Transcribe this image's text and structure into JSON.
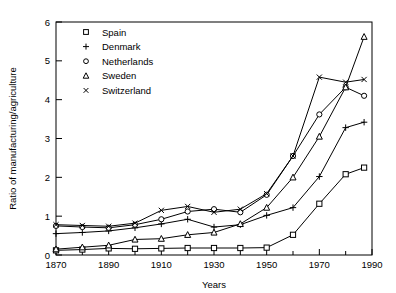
{
  "chart_data": {
    "type": "line",
    "title": "",
    "xlabel": "Years",
    "ylabel": "Ratio of manufacturing/agriculture",
    "xlim": [
      1870,
      1990
    ],
    "ylim": [
      0,
      6
    ],
    "xticks": [
      1870,
      1890,
      1910,
      1930,
      1950,
      1970,
      1990
    ],
    "xtick_labels": [
      "1870",
      "1890",
      "1910",
      "1930",
      "1950",
      "1970",
      "1990"
    ],
    "xminor_step": 10,
    "yticks": [
      0,
      1,
      2,
      3,
      4,
      5,
      6
    ],
    "ytick_labels": [
      "0",
      "1",
      "2",
      "3",
      "4",
      "5",
      "6"
    ],
    "grid": false,
    "legend_position": "top-left",
    "series": [
      {
        "name": "Spain",
        "marker": "square",
        "x": [
          1870,
          1880,
          1890,
          1900,
          1910,
          1920,
          1930,
          1940,
          1950,
          1960,
          1970,
          1980,
          1987
        ],
        "values": [
          0.12,
          0.14,
          0.17,
          0.16,
          0.17,
          0.18,
          0.18,
          0.18,
          0.19,
          0.52,
          1.32,
          2.08,
          2.25
        ]
      },
      {
        "name": "Denmark",
        "marker": "plus",
        "x": [
          1870,
          1880,
          1890,
          1900,
          1910,
          1920,
          1930,
          1940,
          1950,
          1960,
          1970,
          1980,
          1987
        ],
        "values": [
          0.55,
          0.58,
          0.62,
          0.7,
          0.8,
          0.92,
          0.72,
          0.78,
          1.02,
          1.22,
          2.02,
          3.28,
          3.42
        ]
      },
      {
        "name": "Netherlands",
        "marker": "circle",
        "x": [
          1870,
          1880,
          1890,
          1900,
          1910,
          1920,
          1930,
          1940,
          1950,
          1960,
          1970,
          1980,
          1987
        ],
        "values": [
          0.75,
          0.72,
          0.7,
          0.78,
          0.92,
          1.12,
          1.18,
          1.1,
          1.55,
          2.55,
          3.62,
          4.32,
          4.1
        ]
      },
      {
        "name": "Sweden",
        "marker": "triangle",
        "x": [
          1870,
          1880,
          1890,
          1900,
          1910,
          1920,
          1930,
          1940,
          1950,
          1960,
          1970,
          1980,
          1987
        ],
        "values": [
          0.15,
          0.2,
          0.25,
          0.4,
          0.42,
          0.52,
          0.58,
          0.8,
          1.22,
          2.0,
          3.05,
          4.32,
          5.62
        ]
      },
      {
        "name": "Switzerland",
        "marker": "cross",
        "x": [
          1870,
          1880,
          1890,
          1900,
          1910,
          1920,
          1930,
          1940,
          1950,
          1960,
          1970,
          1980,
          1987
        ],
        "values": [
          0.78,
          0.76,
          0.74,
          0.82,
          1.15,
          1.25,
          1.1,
          1.18,
          1.58,
          2.55,
          4.58,
          4.45,
          4.52
        ]
      }
    ]
  },
  "legend": {
    "entries": [
      {
        "label": "Spain",
        "marker": "square"
      },
      {
        "label": "Denmark",
        "marker": "plus"
      },
      {
        "label": "Netherlands",
        "marker": "circle"
      },
      {
        "label": "Sweden",
        "marker": "triangle"
      },
      {
        "label": "Switzerland",
        "marker": "cross"
      }
    ]
  }
}
